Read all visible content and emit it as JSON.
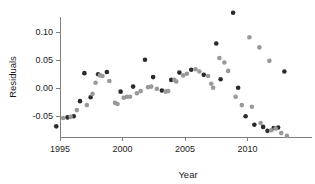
{
  "chart_data": {
    "type": "scatter",
    "title": "",
    "xlabel": "Year",
    "ylabel": "Residuals",
    "xlim": [
      1994.3,
      2013.4
    ],
    "ylim": [
      -0.092,
      0.142
    ],
    "xticks": [
      1995,
      2000,
      2005,
      2010
    ],
    "xticklabels": [
      "1995",
      "2000",
      "2005",
      "2010"
    ],
    "yticks": [
      -0.05,
      0.0,
      0.05,
      0.1
    ],
    "yticklabels": [
      "-0.05",
      "0.00",
      "0.05",
      "0.10"
    ],
    "grid": false,
    "legend": null,
    "colors": {
      "dark": "#2b2b2b",
      "light": "#999999",
      "axis": "#808080",
      "text": "#1a1a1a",
      "background": "#ffffff"
    },
    "series": [
      {
        "name": "dark-points",
        "color": "#2b2b2b",
        "marker": "circle",
        "points": [
          [
            1994.7,
            -0.0685
          ],
          [
            1995.6,
            -0.0525
          ],
          [
            1996.1,
            -0.0505
          ],
          [
            1996.6,
            -0.0235
          ],
          [
            1996.95,
            0.0265
          ],
          [
            1997.45,
            -0.0165
          ],
          [
            1998.05,
            0.0245
          ],
          [
            1998.75,
            0.0285
          ],
          [
            1999.85,
            -0.0065
          ],
          [
            2000.85,
            0.0025
          ],
          [
            2001.8,
            0.0505
          ],
          [
            2002.45,
            0.0195
          ],
          [
            2003.15,
            -0.0045
          ],
          [
            2003.9,
            0.0145
          ],
          [
            2004.55,
            0.0275
          ],
          [
            2005.5,
            0.0325
          ],
          [
            2006.5,
            0.0235
          ],
          [
            2007.5,
            0.0795
          ],
          [
            2007.85,
            0.0155
          ],
          [
            2008.85,
            0.1345
          ],
          [
            2009.25,
            0.0005
          ],
          [
            2009.85,
            -0.0505
          ],
          [
            2010.55,
            -0.0655
          ],
          [
            2011.25,
            -0.0695
          ],
          [
            2011.6,
            -0.0765
          ],
          [
            2012.1,
            -0.0715
          ],
          [
            2012.45,
            -0.0705
          ],
          [
            2012.95,
            0.0295
          ]
        ]
      },
      {
        "name": "light-points",
        "color": "#999999",
        "marker": "circle",
        "points": [
          [
            1995.25,
            -0.0535
          ],
          [
            1995.85,
            -0.0515
          ],
          [
            1996.35,
            -0.0395
          ],
          [
            1997.15,
            -0.0305
          ],
          [
            1997.6,
            -0.0105
          ],
          [
            1997.85,
            0.0095
          ],
          [
            1998.2,
            0.0225
          ],
          [
            1998.4,
            0.0215
          ],
          [
            1998.95,
            0.0125
          ],
          [
            1999.4,
            -0.0265
          ],
          [
            1999.6,
            -0.0285
          ],
          [
            2000.1,
            -0.0175
          ],
          [
            2000.35,
            -0.0155
          ],
          [
            2000.6,
            -0.0155
          ],
          [
            2001.15,
            -0.0095
          ],
          [
            2001.45,
            -0.0055
          ],
          [
            2002.05,
            0.0015
          ],
          [
            2002.3,
            0.0025
          ],
          [
            2002.75,
            -0.0015
          ],
          [
            2003.45,
            -0.0065
          ],
          [
            2003.65,
            -0.0055
          ],
          [
            2004.15,
            0.0145
          ],
          [
            2004.3,
            0.0115
          ],
          [
            2004.85,
            0.0225
          ],
          [
            2005.15,
            0.0255
          ],
          [
            2005.85,
            0.0335
          ],
          [
            2006.15,
            0.0295
          ],
          [
            2006.85,
            0.0215
          ],
          [
            2007.1,
            0.0075
          ],
          [
            2007.25,
            0.0005
          ],
          [
            2007.75,
            0.0535
          ],
          [
            2008.15,
            0.0455
          ],
          [
            2008.45,
            0.0305
          ],
          [
            2009.05,
            -0.0155
          ],
          [
            2009.55,
            -0.0305
          ],
          [
            2010.15,
            0.0905
          ],
          [
            2010.35,
            -0.0335
          ],
          [
            2010.95,
            0.0725
          ],
          [
            2011.05,
            -0.0625
          ],
          [
            2011.75,
            0.0485
          ],
          [
            2011.9,
            -0.0755
          ],
          [
            2012.25,
            -0.0725
          ],
          [
            2012.7,
            -0.0805
          ],
          [
            2013.15,
            -0.0855
          ]
        ]
      }
    ]
  },
  "figure": {
    "plot_area": {
      "x_axis_y_px": 137,
      "y_axis_x_px": 60,
      "x_origin_px": 60,
      "px_per_year": 12.5,
      "y_zero_px": 88,
      "px_per_unit": 560
    },
    "marker_radius_px": 2.3
  }
}
